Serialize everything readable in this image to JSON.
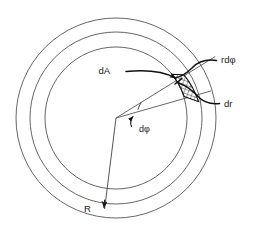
{
  "figure": {
    "background_color": "#ffffff",
    "line_color": "#555555",
    "accent_color": "#111111",
    "width": 253,
    "height": 231
  },
  "geometry": {
    "center": {
      "x": 116,
      "y": 118
    },
    "circles": [
      {
        "name": "outer-circle",
        "radius": 100
      },
      {
        "name": "middle-circle",
        "radius": 86
      },
      {
        "name": "inner-circle",
        "radius": 71
      }
    ],
    "patch": {
      "name": "area-element-patch",
      "fill_pattern": "cross-hatch",
      "inner_radius": 71,
      "outer_radius": 86,
      "angle_start_deg": -38,
      "angle_end_deg": -16
    }
  },
  "labels": {
    "dA": "dA",
    "rdphi": "rdφ",
    "dr": "dr",
    "dphi": "dφ",
    "R": "R"
  },
  "annotations": [
    {
      "name": "label-dA",
      "text": "dA",
      "x": 110,
      "y": 70,
      "leader": "arrow-right-to-patch"
    },
    {
      "name": "label-rdphi",
      "text": "rdφ",
      "x": 222,
      "y": 63,
      "leader": "curve-left-to-patch-top"
    },
    {
      "name": "label-dr",
      "text": "dr",
      "x": 226,
      "y": 107,
      "leader": "curve-left-to-patch-bottom"
    },
    {
      "name": "label-dphi",
      "text": "dφ",
      "x": 141,
      "y": 130,
      "leader": "small-arrow-to-angle-arc"
    },
    {
      "name": "label-R",
      "text": "R",
      "x": 88,
      "y": 211,
      "leader": "arrow-down-to-outer-circle"
    }
  ]
}
